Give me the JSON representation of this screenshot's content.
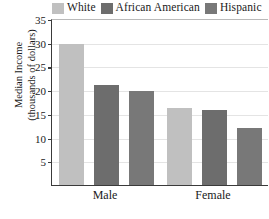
{
  "chart_data": {
    "type": "bar",
    "title": "",
    "xlabel": "",
    "ylabel": "Median Income (thousands of dollars)",
    "ylabel_lines": [
      "Median Income",
      "(thousands of dollars)"
    ],
    "categories": [
      "Male",
      "Female"
    ],
    "series": [
      {
        "name": "White",
        "color": "#c0c0c0",
        "values": [
          30.0,
          16.4
        ]
      },
      {
        "name": "African American",
        "color": "#6d6d6d",
        "values": [
          21.4,
          16.0
        ]
      },
      {
        "name": "Hispanic",
        "color": "#787878",
        "values": [
          20.1,
          12.2
        ]
      }
    ],
    "ylim": [
      0,
      35
    ],
    "yticks": [
      5,
      10,
      15,
      20,
      25,
      30,
      35
    ],
    "ytick_labels": [
      "5",
      "10",
      "15",
      "20",
      "25",
      "30",
      "35"
    ],
    "grid": true,
    "legend_position": "top"
  },
  "legend": {
    "entries": [
      {
        "label": "White",
        "swatch": "legend-swatch-white"
      },
      {
        "label": "African American",
        "swatch": "legend-swatch-african-american"
      },
      {
        "label": "Hispanic",
        "swatch": "legend-swatch-hispanic"
      }
    ]
  },
  "colors": {
    "white_series": "#c0c0c0",
    "african_american_series": "#6d6d6d",
    "hispanic_series": "#787878",
    "axis": "#3a3a3a",
    "gridline": "#e4e4e4",
    "background": "#ffffff"
  }
}
